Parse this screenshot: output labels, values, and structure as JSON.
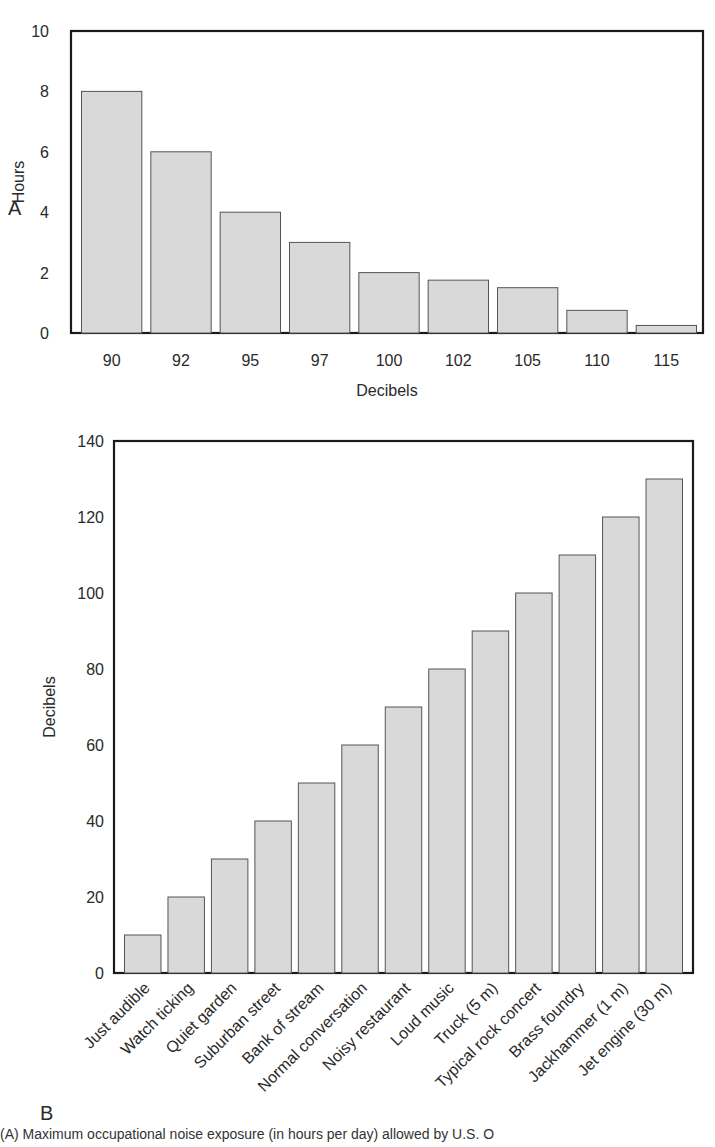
{
  "figure": {
    "panel_a_label": "A",
    "panel_b_label": "B",
    "caption": "(A) Maximum occupational noise exposure (in hours per day) allowed by U.S. O"
  },
  "colors": {
    "bar_fill": "#d9d9d9",
    "bar_stroke": "#555555",
    "axis": "#1a1a1a",
    "background": "#ffffff"
  },
  "chart_data": [
    {
      "type": "bar",
      "panel": "A",
      "title": "",
      "xlabel": "Decibels",
      "ylabel": "Hours",
      "categories": [
        "90",
        "92",
        "95",
        "97",
        "100",
        "102",
        "105",
        "110",
        "115"
      ],
      "values": [
        8,
        6,
        4,
        3,
        2,
        1.75,
        1.5,
        0.75,
        0.25
      ],
      "ylim": [
        0,
        10
      ],
      "yticks": [
        0,
        2,
        4,
        6,
        8,
        10
      ],
      "grid": false,
      "legend": null
    },
    {
      "type": "bar",
      "panel": "B",
      "title": "",
      "xlabel": "",
      "ylabel": "Decibels",
      "categories": [
        "Just audible",
        "Watch ticking",
        "Quiet garden",
        "Suburban street",
        "Bank of stream",
        "Normal conversation",
        "Noisy restaurant",
        "Loud music",
        "Truck (5 m)",
        "Typical rock concert",
        "Brass foundry",
        "Jackhammer (1 m)",
        "Jet engine (30 m)"
      ],
      "values": [
        10,
        20,
        30,
        40,
        50,
        60,
        70,
        80,
        90,
        100,
        110,
        120,
        130
      ],
      "ylim": [
        0,
        140
      ],
      "yticks": [
        0,
        20,
        40,
        60,
        80,
        100,
        120,
        140
      ],
      "grid": false,
      "legend": null,
      "xtick_rotation": -45
    }
  ]
}
